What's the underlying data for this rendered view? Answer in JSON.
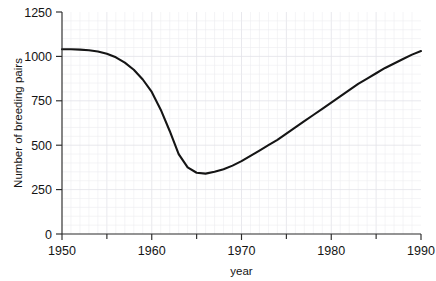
{
  "chart_data": {
    "type": "line",
    "title": "",
    "subtitle": "",
    "xlabel": "year",
    "ylabel": "Number of breeding pairs",
    "xlim": [
      1950,
      1990
    ],
    "ylim": [
      0,
      1250
    ],
    "xticks": [
      1950,
      1960,
      1970,
      1980,
      1990
    ],
    "xtick_labels": [
      "1950",
      "1960",
      "1970",
      "1980",
      "1990"
    ],
    "xticks_minor": [
      1955,
      1965,
      1975,
      1985
    ],
    "yticks": [
      0,
      250,
      500,
      750,
      1000,
      1250
    ],
    "ytick_labels": [
      "0",
      "250",
      "500",
      "750",
      "1000",
      "1250"
    ],
    "grid": true,
    "grid_style": "faint light-gray minor and major grid",
    "legend": "none",
    "legend_position": "none",
    "line_color": "#151515",
    "series": [
      {
        "name": "Number of breeding pairs",
        "x": [
          1950,
          1951,
          1952,
          1953,
          1954,
          1955,
          1956,
          1957,
          1958,
          1959,
          1960,
          1961,
          1962,
          1963,
          1964,
          1965,
          1966,
          1967,
          1968,
          1969,
          1970,
          1971,
          1972,
          1973,
          1974,
          1975,
          1976,
          1977,
          1978,
          1979,
          1980,
          1981,
          1982,
          1983,
          1984,
          1985,
          1986,
          1987,
          1988,
          1989,
          1990
        ],
        "values": [
          1040,
          1040,
          1038,
          1035,
          1028,
          1015,
          995,
          965,
          925,
          870,
          800,
          700,
          580,
          450,
          375,
          345,
          340,
          350,
          365,
          385,
          410,
          440,
          470,
          500,
          530,
          565,
          600,
          635,
          670,
          705,
          740,
          775,
          810,
          845,
          875,
          905,
          935,
          960,
          985,
          1010,
          1030
        ]
      }
    ],
    "annotations": []
  },
  "axes": {
    "x_axis_label": "year",
    "y_axis_label": "Number of breeding pairs"
  }
}
